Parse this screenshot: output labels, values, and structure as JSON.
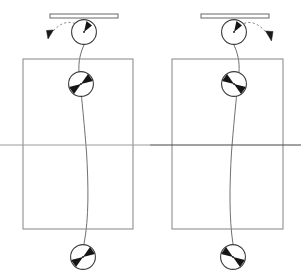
{
  "figure": {
    "type": "physics-diagram",
    "title": "",
    "caption": "",
    "width": 301,
    "height": 280,
    "background_color": "#ffffff",
    "stroke_color": "#555555",
    "dark_stroke_color": "#333333",
    "fill_color": "#1a1a1a",
    "panel_count": 2,
    "mirror_symmetry": "left panel mirrored horizontally to form right panel",
    "reference_line": {
      "name": "horizontal-midline",
      "y": 145,
      "x_start": 0,
      "x_end": 301,
      "color_left": "#9a9a9a",
      "color_right": "#444444",
      "description": "full-width horizontal reference line crossing both panels"
    }
  },
  "panels": [
    {
      "id": "left-panel",
      "label": "left",
      "bar": {
        "name": "support-bar",
        "x": 50,
        "y": 14,
        "width": 68,
        "height": 4,
        "description": "thin horizontal support bar outline at top"
      },
      "top_ball": {
        "name": "top-ball",
        "cx": 84,
        "cy": 32,
        "r": 13,
        "marker_angle_deg": 52,
        "marker_direction": "up-right",
        "description": "circle with small dark wedge marker pointing up-right and a center dot"
      },
      "dashed_arrow": {
        "name": "dashed-motion-arrow",
        "start_x": 74,
        "start_y": 24,
        "end_x": 50,
        "end_y": 36,
        "direction": "leftward-downward",
        "style": "dashed curve terminating in filled arrowhead"
      },
      "frame": {
        "name": "reference-frame-box",
        "x": 23,
        "y": 59,
        "width": 110,
        "height": 170,
        "description": "tall rectangular frame outline"
      },
      "middle_ball": {
        "name": "middle-ball",
        "cx": 81,
        "cy": 84,
        "r": 13,
        "wedges": [
          "upper-right",
          "lower-left"
        ],
        "description": "circle with two opposed dark wedges and center dot"
      },
      "bottom_ball": {
        "name": "bottom-ball",
        "cx": 83,
        "cy": 257,
        "r": 13,
        "wedges": [
          "upper-right",
          "lower-left"
        ],
        "description": "circle with two opposed dark wedges and center dot"
      },
      "string": {
        "name": "string-curve",
        "from": "top-ball",
        "through": "middle-ball",
        "to": "bottom-ball",
        "curvature": "bows slightly left of vertical",
        "points": [
          [
            84,
            45
          ],
          [
            80,
            62
          ],
          [
            79,
            72
          ],
          [
            81,
            97
          ],
          [
            86,
            150
          ],
          [
            88,
            200
          ],
          [
            84,
            244
          ]
        ]
      }
    },
    {
      "id": "right-panel",
      "label": "right",
      "bar": {
        "name": "support-bar",
        "x": 201,
        "y": 14,
        "width": 68,
        "height": 4,
        "description": "thin horizontal support bar outline at top"
      },
      "top_ball": {
        "name": "top-ball",
        "cx": 234,
        "cy": 32,
        "r": 13,
        "marker_angle_deg": 128,
        "marker_direction": "up-left",
        "description": "circle with small dark wedge marker pointing up-left and a center dot"
      },
      "dashed_arrow": {
        "name": "dashed-motion-arrow",
        "start_x": 245,
        "start_y": 24,
        "end_x": 269,
        "end_y": 38,
        "direction": "rightward-downward",
        "style": "dashed curve terminating in filled arrowhead"
      },
      "frame": {
        "name": "reference-frame-box",
        "x": 172,
        "y": 59,
        "width": 111,
        "height": 170,
        "description": "tall rectangular frame outline"
      },
      "middle_ball": {
        "name": "middle-ball",
        "cx": 234,
        "cy": 84,
        "r": 13,
        "wedges": [
          "upper-left",
          "lower-right"
        ],
        "description": "circle with two opposed dark wedges and center dot"
      },
      "bottom_ball": {
        "name": "bottom-ball",
        "cx": 233,
        "cy": 257,
        "r": 13,
        "wedges": [
          "upper-left",
          "lower-right"
        ],
        "description": "circle with two opposed dark wedges and center dot"
      },
      "string": {
        "name": "string-curve",
        "from": "top-ball",
        "through": "middle-ball",
        "to": "bottom-ball",
        "curvature": "bows slightly right of vertical",
        "points": [
          [
            234,
            45
          ],
          [
            237,
            62
          ],
          [
            238,
            72
          ],
          [
            236,
            97
          ],
          [
            231,
            150
          ],
          [
            229,
            200
          ],
          [
            233,
            244
          ]
        ]
      }
    }
  ]
}
